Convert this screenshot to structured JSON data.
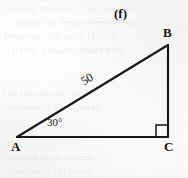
{
  "figure": {
    "panel_letter": "(f)",
    "vertices": [
      {
        "name": "A",
        "label": "A",
        "x": 17,
        "y": 137
      },
      {
        "name": "B",
        "label": "B",
        "x": 168,
        "y": 45
      },
      {
        "name": "C",
        "label": "C",
        "x": 168,
        "y": 137
      }
    ],
    "labels": {
      "vertex_a": "A",
      "vertex_b": "B",
      "vertex_c": "C",
      "hypotenuse_length": "50",
      "angle_at_a": "30°"
    },
    "right_angle_vertex": "C",
    "colors": {
      "stroke": "#16161a",
      "paper": "#f7f7f5",
      "text": "#16161a"
    },
    "background_bleed": [
      "the vast majority of the questions",
      "solutions to the problems below",
      "Determine the value of each",
      "for the triangles shown here",
      "Use the ratio to find the",
      "measure of the missing",
      "rounded to the nearest",
      "solution 2. (d) 5 and"
    ]
  }
}
